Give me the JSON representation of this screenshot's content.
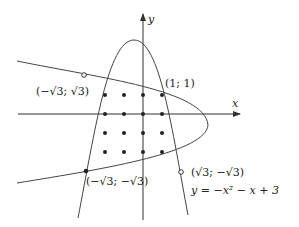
{
  "axes": {
    "x_label": "x",
    "y_label": "y"
  },
  "curves": {
    "vertical_parabola_equation": "y = −x² − x + 3",
    "horizontal_parabola_description": "sideways parabola opening left"
  },
  "labeled_points": [
    {
      "label": "(−√3; √3)",
      "marker": "open"
    },
    {
      "label": "(1; 1)",
      "marker": "filled"
    },
    {
      "label": "(−√3; −√3)",
      "marker": "filled"
    },
    {
      "label": "(√3; −√3)",
      "marker": "open"
    }
  ],
  "grid_points": {
    "columns_x": [
      -2,
      -1,
      0,
      1
    ],
    "rows_y": [
      1,
      0,
      -1,
      -2
    ],
    "marker": "filled"
  },
  "colors": {
    "stroke": "#444444",
    "background": "#ffffff"
  }
}
